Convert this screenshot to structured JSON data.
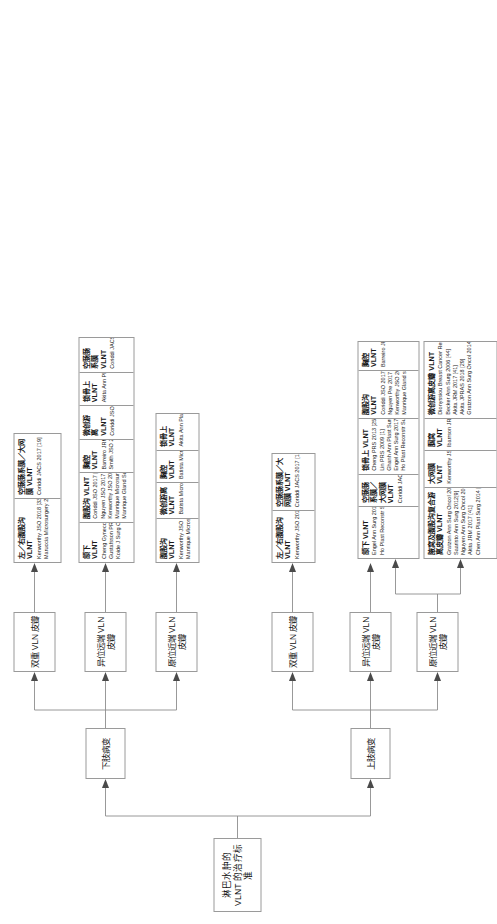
{
  "figure": {
    "title": "淋巴水肿的 VLNT 的治疗标准",
    "orientation": "left-to-right tree, page rotated 90°"
  },
  "level2": [
    {
      "id": "upper",
      "label": "上肢病变"
    },
    {
      "id": "lower",
      "label": "下肢病变"
    }
  ],
  "level3": [
    {
      "id": "u-prox",
      "parent": "upper",
      "label": "原位近端 VLN 皮瓣"
    },
    {
      "id": "u-dist",
      "parent": "upper",
      "label": "异位远端 VLN 皮瓣"
    },
    {
      "id": "u-dual",
      "parent": "upper",
      "label": "双重 VLN 皮瓣"
    },
    {
      "id": "l-prox",
      "parent": "lower",
      "label": "原位近端 VLN 皮瓣"
    },
    {
      "id": "l-dist",
      "parent": "lower",
      "label": "异位远端 VLN 皮瓣"
    },
    {
      "id": "l-dual",
      "parent": "lower",
      "label": "双重 VLN 皮瓣"
    }
  ],
  "leafgroups": [
    {
      "id": "g-u-prox",
      "parent": "u-prox",
      "columns": [
        {
          "header": "腋窝及腹股沟复合游离皮瓣 VLNT",
          "refs": [
            "Gratzon Ann Surg Oncol 2017 [42]",
            "Saaristo Ann Surg 2012[9]",
            "Nguyen Ann Surg Oncol 2015 [10]",
            "Akita JRM 2017 [41]",
            "Chen Ann Plast Surg 2014 [43]"
          ]
        },
        {
          "header": "大网膜 VLNT",
          "refs": [
            "Kenworthy JSO 2018 [33]"
          ]
        },
        {
          "header": "腘窝 VLNT",
          "refs": [
            "Ibarrson JRM 2014 [6]"
          ]
        },
        {
          "header": "微创游离皮瓣 VLNT",
          "refs": [
            "Dionyssiou Breast Cancer Res Treat 2016 [5]",
            "Becker Ann Surg 2006 [44]",
            "Akita JRM 2017 [41]",
            "Akita JPRAS 2018 [29]",
            "Gratzon Ann Surg Oncol 2014 [46]"
          ]
        }
      ]
    },
    {
      "id": "g-u-dist",
      "parent": "u-dist",
      "columns": [
        {
          "header": "颌下 VLNT",
          "refs": [
            "Engel Ann Surg 2017[30]",
            "Ho Plast Reconstr Surg Glob Open 2018 [16]"
          ]
        },
        {
          "header": "空肠肠系膜／大网膜 VLNT",
          "refs": [
            "Coriddi JACS 2017 [19]"
          ]
        },
        {
          "header": "锁骨上 VLNT",
          "refs": [
            "Cheng PRS 2013 [25]",
            "Lin PRS 2009 [1]",
            "Ghanh Ann Plast Surg 2018 [47]",
            "Engel Ann Surg 2017 [30]",
            "Ho Plast Reconstr Surg Glob Open 2018 [16]"
          ]
        },
        {
          "header": "腹股沟 VLNT",
          "refs": [
            "Coriddi JSO 2017 [20]",
            "Nguyen Pre 2017 [18]",
            "Kenworthy JSO 2018 [33]",
            "Manrique Gland surg 2020 [41]"
          ]
        },
        {
          "header": "胸腔 VLNT",
          "refs": [
            "Barreiro JRM 2014 [6]"
          ]
        }
      ]
    },
    {
      "id": "g-u-dual",
      "parent": "u-dual",
      "columns": [
        {
          "header": "左／右腹股沟 VLNT",
          "refs": [
            "Kenworthy JSO 2018 [33]"
          ]
        },
        {
          "header": "空肠肠系膜／大网膜 VLNT",
          "refs": [
            "Coriddi JACS 2017 [19]"
          ]
        }
      ]
    },
    {
      "id": "g-l-prox",
      "parent": "l-prox",
      "columns": [
        {
          "header": "腹股沟 VLNT",
          "refs": [
            "Kenworthy JSO 2018 [33]",
            "Manrique Microsurgery 2019[40]"
          ]
        },
        {
          "header": "微创游离 VLNT",
          "refs": [
            "Batista Microsurgery 2017[34]"
          ]
        },
        {
          "header": "胸腔 VLNT",
          "refs": [
            "Batista Microsurgery 2017 [34]"
          ]
        },
        {
          "header": "锁骨上 VLNT",
          "refs": [
            "Akita Ann Plast Surg 2015 [13]"
          ]
        }
      ]
    },
    {
      "id": "g-l-dist",
      "parent": "l-dist",
      "columns": [
        {
          "header": "颌下 VLNT",
          "refs": [
            "Cheng Gynecol Oncol 2012 [15]",
            "Gustafsson PRS 2018 [48]",
            "Koide J Surg Oncol 2020 [38]"
          ]
        },
        {
          "header": "腹股沟 VLNT",
          "refs": [
            "Coriddi JSO 2017 [20]",
            "Nguyen JSO 2017 [18]",
            "Kenworthy JSO 2018 [33]",
            "Manrique Microsurgery 2019 [40]",
            "Manrique Gland Surg 2020 [41]"
          ]
        },
        {
          "header": "胸腔 VLNT",
          "refs": [
            "Barreiro JRM 2014 [6]",
            "Smith JSO 2017 [7]"
          ]
        },
        {
          "header": "微创游离 VLNT",
          "refs": [
            "Coriddi JSO 2017 [20]"
          ]
        },
        {
          "header": "锁骨上 VLNT",
          "refs": [
            "Akita Ann Plast Surg 2015[13]"
          ]
        },
        {
          "header": "空肠肠系膜 VLNT",
          "refs": [
            "Coriddi JACS 2017 [19]"
          ]
        }
      ]
    },
    {
      "id": "g-l-dual",
      "parent": "l-dual",
      "columns": [
        {
          "header": "左／右腹股沟 VLNT",
          "refs": [
            "Kenworthy JSO 2018 [33]",
            "Maruccia Microsurgery 2019 [40]"
          ]
        },
        {
          "header": "空肠肠系膜／大网膜 VLNT",
          "refs": [
            "Coriddi JACS 2017 [19]"
          ]
        }
      ]
    }
  ]
}
